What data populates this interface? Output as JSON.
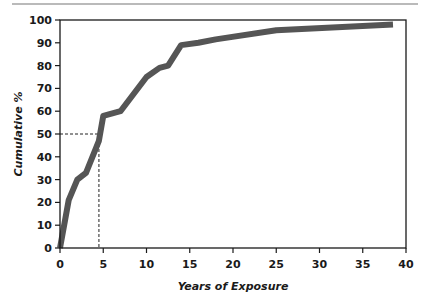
{
  "chart_data": {
    "type": "line",
    "title": "",
    "xlabel": "Years of Exposure",
    "ylabel": "Cumulative %",
    "xlim": [
      0,
      40
    ],
    "ylim": [
      0,
      100
    ],
    "x_ticks": [
      0,
      5,
      10,
      15,
      20,
      25,
      30,
      35,
      40
    ],
    "y_ticks": [
      0,
      10,
      20,
      30,
      40,
      50,
      60,
      70,
      80,
      90,
      100
    ],
    "grid": false,
    "legend": null,
    "series": [
      {
        "name": "Cumulative %",
        "x": [
          0,
          1,
          2,
          3,
          4.5,
          5,
          7,
          10,
          11.5,
          12.5,
          14,
          16,
          18,
          25,
          38.5
        ],
        "y": [
          0,
          21,
          30,
          33,
          47,
          58,
          60,
          75,
          79,
          80,
          89,
          90,
          91.5,
          95.5,
          98
        ],
        "color": "#555555"
      }
    ],
    "annotations": [
      {
        "type": "dashed-reference",
        "x": 4.5,
        "y": 50,
        "description": "median exposure at 50% cumulative"
      }
    ]
  },
  "colors": {
    "line": "#555555",
    "axis": "#1a1a1a",
    "rule": "#777777"
  }
}
